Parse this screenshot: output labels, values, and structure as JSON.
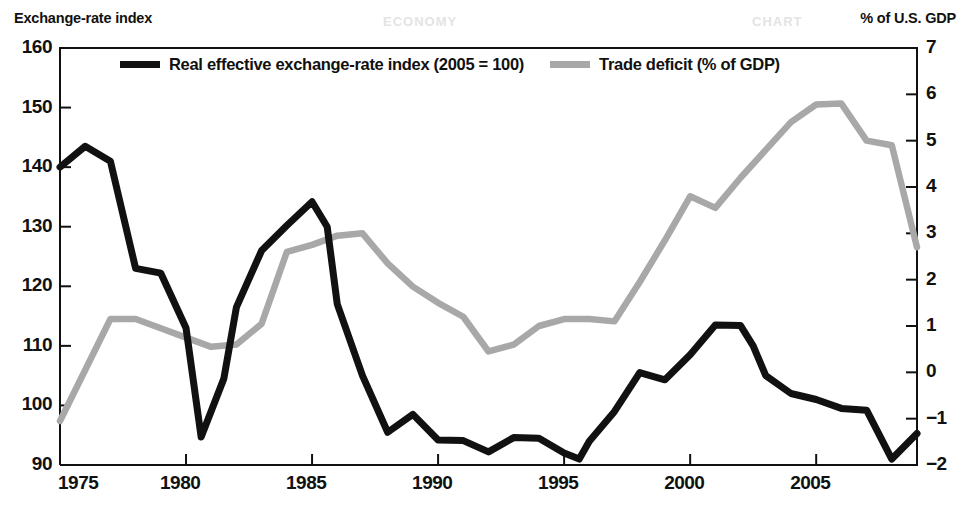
{
  "titles": {
    "left_axis": "Exchange-rate index",
    "right_axis": "% of U.S. GDP"
  },
  "watermarks": {
    "one": "ECONOMY",
    "two": "CHART"
  },
  "legend": {
    "series_black": "Real effective exchange-rate index (2005 = 100)",
    "series_grey": "Trade deficit (% of GDP)"
  },
  "colors": {
    "black_line": "#111111",
    "grey_line": "#a8a8a8",
    "axis": "#111111",
    "background": "#ffffff"
  },
  "chart_data": {
    "type": "line",
    "title": "",
    "subtitle": "",
    "xlabel": "",
    "ylabel": "Exchange-rate index",
    "y2label": "% of U.S. GDP",
    "xlim": [
      1975,
      2009
    ],
    "ylim": [
      90,
      160
    ],
    "y2lim": [
      -2,
      7
    ],
    "grid": false,
    "legend_position": "top-inside",
    "x_ticks": [
      1975,
      1980,
      1985,
      1990,
      1995,
      2000,
      2005
    ],
    "x_tick_labels": [
      "1975",
      "1980",
      "1985",
      "1990",
      "1995",
      "2000",
      "2005"
    ],
    "y_ticks": [
      90,
      100,
      110,
      120,
      130,
      140,
      150,
      160
    ],
    "y_tick_labels": [
      "90",
      "100",
      "110",
      "120",
      "130",
      "140",
      "150",
      "160"
    ],
    "y2_ticks": [
      -2,
      -1,
      0,
      1,
      2,
      3,
      4,
      5,
      6,
      7
    ],
    "y2_tick_labels": [
      "−2",
      "−1",
      "0",
      "1",
      "2",
      "3",
      "4",
      "5",
      "6",
      "7"
    ],
    "series": [
      {
        "name": "Real effective exchange-rate index (2005 = 100)",
        "axis": "left",
        "color": "#111111",
        "x": [
          1975,
          1976,
          1977,
          1978,
          1979,
          1980,
          1980.6,
          1981.5,
          1982,
          1983,
          1984,
          1985,
          1985.6,
          1986,
          1987,
          1988,
          1989,
          1990,
          1991,
          1992,
          1993,
          1994,
          1995,
          1995.6,
          1996,
          1997,
          1998,
          1999,
          2000,
          2001,
          2002,
          2002.5,
          2003,
          2004,
          2005,
          2006,
          2007,
          2008,
          2009
        ],
        "y": [
          140.0,
          143.5,
          141.0,
          123.0,
          122.2,
          113.0,
          94.7,
          104.5,
          116.5,
          126.0,
          130.2,
          134.2,
          130.0,
          117.0,
          105.0,
          95.5,
          98.5,
          94.2,
          94.1,
          92.2,
          94.6,
          94.5,
          92.0,
          91.0,
          94.0,
          99.0,
          105.5,
          104.3,
          108.5,
          113.5,
          113.4,
          110.0,
          105.0,
          102.0,
          101.0,
          99.5,
          99.2,
          91.0,
          95.3
        ]
      },
      {
        "name": "Trade deficit (% of GDP)",
        "axis": "right",
        "color": "#a8a8a8",
        "x": [
          1975,
          1976,
          1977,
          1978,
          1979,
          1980,
          1981,
          1982,
          1983,
          1984,
          1985,
          1986,
          1987,
          1988,
          1989,
          1990,
          1991,
          1992,
          1993,
          1994,
          1995,
          1996,
          1997,
          1998,
          1999,
          2000,
          2001,
          2002,
          2003,
          2004,
          2005,
          2006,
          2007,
          2008,
          2009
        ],
        "y": [
          -1.05,
          0.05,
          1.15,
          1.15,
          0.95,
          0.75,
          0.55,
          0.6,
          1.05,
          2.6,
          2.75,
          2.95,
          3.0,
          2.35,
          1.85,
          1.5,
          1.2,
          0.45,
          0.6,
          1.0,
          1.15,
          1.15,
          1.1,
          1.95,
          2.85,
          3.8,
          3.55,
          4.2,
          4.8,
          5.4,
          5.78,
          5.8,
          5.0,
          4.9,
          2.7
        ]
      }
    ]
  },
  "geometry": {
    "plot": {
      "left": 60,
      "right": 917,
      "top": 48,
      "bottom": 465
    }
  }
}
